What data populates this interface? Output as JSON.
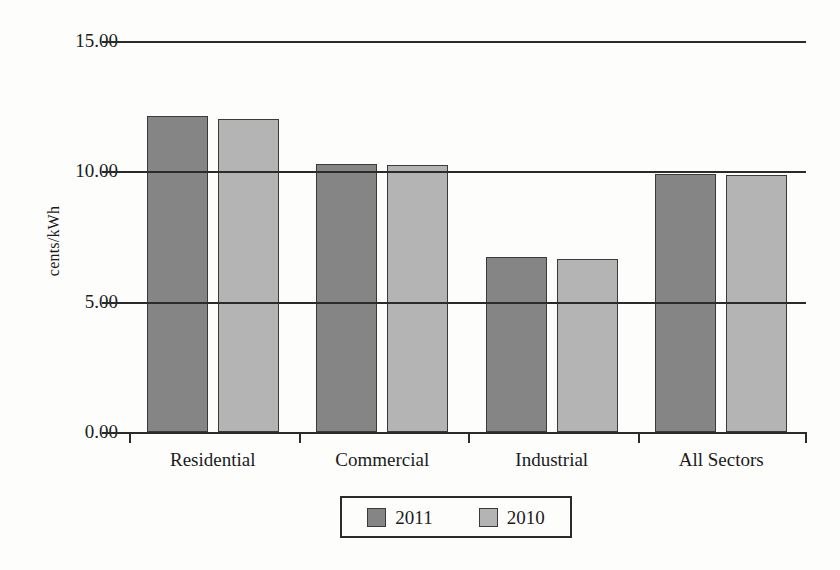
{
  "chart_data": {
    "type": "bar",
    "title": "",
    "xlabel": "",
    "ylabel": "cents/kWh",
    "categories": [
      "Residential",
      "Commercial",
      "Industrial",
      "All Sectors"
    ],
    "series": [
      {
        "name": "2011",
        "color": "#858585",
        "values": [
          12.14,
          10.28,
          6.73,
          9.89
        ]
      },
      {
        "name": "2010",
        "color": "#b4b4b4",
        "values": [
          12.02,
          10.26,
          6.65,
          9.87
        ]
      }
    ],
    "ylim": [
      0,
      15
    ],
    "yticks": [
      0,
      5,
      10,
      15
    ],
    "ytick_labels": [
      "0.00",
      "5.00",
      "10.00",
      "15.00"
    ],
    "grid": true,
    "legend_position": "bottom",
    "legend_entries": [
      "2011",
      "2010"
    ]
  }
}
